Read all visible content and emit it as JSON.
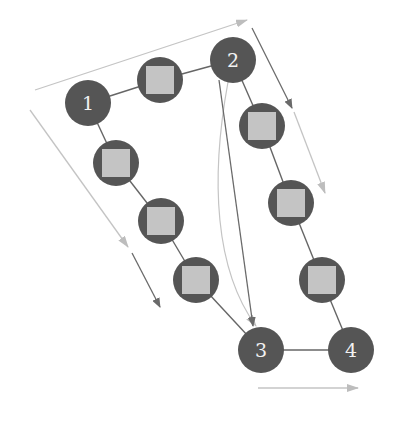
{
  "diagram": {
    "colors": {
      "node_fill": "#555555",
      "square_fill": "#c4c4c4",
      "edge": "#666666",
      "arrow_dark": "#6a6a6a",
      "arrow_light": "#bdbdbd"
    },
    "numbered_nodes": [
      {
        "id": "1",
        "label": "1",
        "x": 88,
        "y": 103
      },
      {
        "id": "2",
        "label": "2",
        "x": 233,
        "y": 60
      },
      {
        "id": "3",
        "label": "3",
        "x": 261,
        "y": 350
      },
      {
        "id": "4",
        "label": "4",
        "x": 351,
        "y": 350
      }
    ],
    "square_nodes": [
      {
        "x": 160,
        "y": 80
      },
      {
        "x": 116,
        "y": 163
      },
      {
        "x": 161,
        "y": 221
      },
      {
        "x": 196,
        "y": 280
      },
      {
        "x": 262,
        "y": 126
      },
      {
        "x": 291,
        "y": 203
      },
      {
        "x": 322,
        "y": 280
      }
    ],
    "paths": [
      {
        "name": "path-1-2",
        "from": "1",
        "to": "2"
      },
      {
        "name": "path-1-3",
        "from": "1",
        "to": "3"
      },
      {
        "name": "path-2-4",
        "from": "2",
        "to": "4"
      },
      {
        "name": "path-3-4",
        "from": "3",
        "to": "4"
      },
      {
        "name": "direct-2-3",
        "from": "2",
        "to": "3"
      }
    ]
  }
}
